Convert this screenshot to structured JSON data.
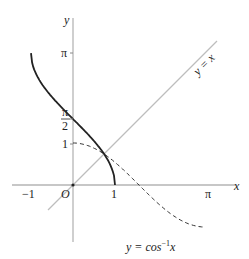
{
  "chart_data": {
    "type": "line",
    "title": "",
    "xlabel": "x",
    "ylabel": "y",
    "origin_label": "O",
    "x_ticks": [
      "−1",
      "1",
      "π"
    ],
    "y_ticks": [
      "1",
      "π/2",
      "π"
    ],
    "xlim": [
      -1.3,
      3.6
    ],
    "ylim": [
      -1.8,
      3.6
    ],
    "series": [
      {
        "name": "y = cos⁻¹x",
        "style": "solid",
        "domain": [
          -1,
          1
        ],
        "points": [
          [
            -1,
            3.1416
          ],
          [
            -0.5,
            2.0944
          ],
          [
            0,
            1.5708
          ],
          [
            0.5,
            1.0472
          ],
          [
            0.7391,
            0.7391
          ],
          [
            1,
            0
          ]
        ]
      },
      {
        "name": "y = cos x",
        "style": "dashed",
        "domain": [
          0,
          3.1416
        ],
        "points": [
          [
            0,
            1
          ],
          [
            0.7391,
            0.7391
          ],
          [
            1.5708,
            0
          ],
          [
            2.5,
            -0.801
          ],
          [
            3.1416,
            -1
          ]
        ]
      },
      {
        "name": "y = x",
        "style": "solid-gray",
        "domain": [
          -0.6,
          3.4
        ],
        "points": [
          [
            -0.6,
            -0.6
          ],
          [
            3.4,
            3.4
          ]
        ]
      }
    ],
    "annotations": [
      "y = x",
      "y = cos⁻¹x"
    ]
  },
  "labels": {
    "y_axis": "y",
    "x_axis": "x",
    "origin": "O",
    "x_minus_one": "−1",
    "x_one": "1",
    "x_pi": "π",
    "y_one": "1",
    "y_pi": "π",
    "y_half_pi_num": "π",
    "y_half_pi_den": "2",
    "line_label": "y = x",
    "curve_label_prefix": "y = cos",
    "curve_label_sup": "−1",
    "curve_label_suffix": "x"
  },
  "colors": {
    "axis": "#b0b0b0",
    "curve": "#222222",
    "line": "#b8b8b8"
  }
}
